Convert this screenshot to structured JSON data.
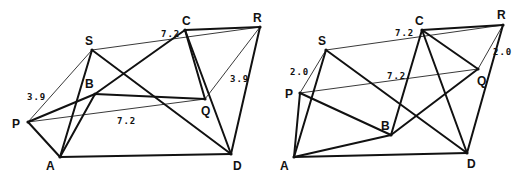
{
  "figures": [
    {
      "id": "left",
      "points": {
        "P": {
          "x": 28,
          "y": 122,
          "lx": 12,
          "ly": 128
        },
        "A": {
          "x": 60,
          "y": 157,
          "lx": 46,
          "ly": 170
        },
        "S": {
          "x": 92,
          "y": 50,
          "lx": 85,
          "ly": 45
        },
        "B": {
          "x": 95,
          "y": 94,
          "lx": 85,
          "ly": 88
        },
        "C": {
          "x": 185,
          "y": 30,
          "lx": 182,
          "ly": 25
        },
        "R": {
          "x": 260,
          "y": 27,
          "lx": 253,
          "ly": 22
        },
        "Q": {
          "x": 205,
          "y": 99,
          "lx": 201,
          "ly": 115
        },
        "D": {
          "x": 231,
          "y": 154,
          "lx": 233,
          "ly": 170
        }
      },
      "labels": {
        "P": "P",
        "A": "A",
        "S": "S",
        "B": "B",
        "C": "C",
        "R": "R",
        "Q": "Q",
        "D": "D"
      },
      "lengths": [
        {
          "text": "3.9",
          "x": 27,
          "y": 100
        },
        {
          "text": "7.2",
          "x": 161,
          "y": 37
        },
        {
          "text": "3.9",
          "x": 230,
          "y": 82
        },
        {
          "text": "7.2",
          "x": 117,
          "y": 124
        }
      ],
      "thick_edges": [
        [
          "P",
          "A"
        ],
        [
          "P",
          "B"
        ],
        [
          "A",
          "S"
        ],
        [
          "A",
          "B"
        ],
        [
          "A",
          "D"
        ],
        [
          "S",
          "D"
        ],
        [
          "B",
          "C"
        ],
        [
          "B",
          "Q"
        ],
        [
          "C",
          "R"
        ],
        [
          "C",
          "Q"
        ],
        [
          "C",
          "D"
        ],
        [
          "R",
          "D"
        ]
      ],
      "thin_edges": [
        [
          "P",
          "S"
        ],
        [
          "P",
          "Q"
        ],
        [
          "S",
          "R"
        ],
        [
          "R",
          "Q"
        ]
      ]
    },
    {
      "id": "right",
      "points": {
        "S": {
          "x": 326,
          "y": 50,
          "lx": 318,
          "ly": 45
        },
        "P": {
          "x": 300,
          "y": 93,
          "lx": 285,
          "ly": 98
        },
        "A": {
          "x": 294,
          "y": 157,
          "lx": 280,
          "ly": 170
        },
        "B": {
          "x": 391,
          "y": 135,
          "lx": 381,
          "ly": 130
        },
        "C": {
          "x": 422,
          "y": 30,
          "lx": 415,
          "ly": 25
        },
        "R": {
          "x": 503,
          "y": 25,
          "lx": 497,
          "ly": 19
        },
        "Q": {
          "x": 478,
          "y": 69,
          "lx": 477,
          "ly": 85
        },
        "D": {
          "x": 467,
          "y": 153,
          "lx": 467,
          "ly": 168
        }
      },
      "labels": {
        "S": "S",
        "P": "P",
        "A": "A",
        "B": "B",
        "C": "C",
        "R": "R",
        "Q": "Q",
        "D": "D"
      },
      "lengths": [
        {
          "text": "2.0",
          "x": 290,
          "y": 75
        },
        {
          "text": "7.2",
          "x": 395,
          "y": 36
        },
        {
          "text": "7.2",
          "x": 387,
          "y": 79
        },
        {
          "text": "2.0",
          "x": 493,
          "y": 55
        }
      ],
      "thick_edges": [
        [
          "P",
          "A"
        ],
        [
          "P",
          "B"
        ],
        [
          "A",
          "S"
        ],
        [
          "A",
          "B"
        ],
        [
          "A",
          "D"
        ],
        [
          "S",
          "D"
        ],
        [
          "B",
          "C"
        ],
        [
          "B",
          "Q"
        ],
        [
          "C",
          "R"
        ],
        [
          "C",
          "Q"
        ],
        [
          "C",
          "D"
        ],
        [
          "R",
          "D"
        ]
      ],
      "thin_edges": [
        [
          "P",
          "S"
        ],
        [
          "P",
          "Q"
        ],
        [
          "S",
          "R"
        ],
        [
          "R",
          "Q"
        ]
      ]
    }
  ]
}
